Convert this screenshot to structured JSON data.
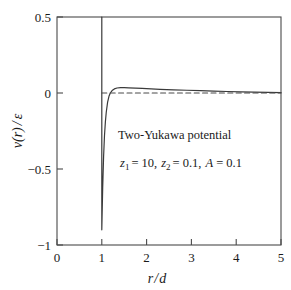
{
  "chart_data": {
    "type": "line",
    "title": "",
    "xlabel": "r/d",
    "ylabel": "v(r) / ε",
    "xlim": [
      0,
      5
    ],
    "ylim": [
      -1,
      0.5
    ],
    "xticks": [
      "0",
      "1",
      "2",
      "3",
      "4",
      "5"
    ],
    "xtick_values": [
      0,
      1,
      2,
      3,
      4,
      5
    ],
    "yticks": [
      "0.5",
      "0",
      "-0.5",
      "-1"
    ],
    "ytick_values": [
      0.5,
      0,
      -0.5,
      -1
    ],
    "grid": false,
    "legend": "none",
    "annotations": [
      {
        "text": "Two-Yukawa potential",
        "x": 1.55,
        "y": -0.33
      },
      {
        "text": "z1 = 10, z2 = 0.1, A = 0.1",
        "x": 1.55,
        "y": -0.5
      }
    ],
    "series": [
      {
        "name": "two-yukawa-potential",
        "style": "solid",
        "color": "#3a3a3a",
        "comment": "hard core vertical drop at r/d = 1, minimum -0.9, small positive maximum then decay",
        "points": [
          [
            1.0,
            -0.9
          ],
          [
            1.0,
            0.5
          ],
          [
            1.0,
            -0.9
          ],
          [
            1.02,
            -0.62
          ],
          [
            1.04,
            -0.42
          ],
          [
            1.06,
            -0.28
          ],
          [
            1.08,
            -0.19
          ],
          [
            1.1,
            -0.125
          ],
          [
            1.13,
            -0.06
          ],
          [
            1.16,
            -0.022
          ],
          [
            1.19,
            0.0
          ],
          [
            1.23,
            0.016
          ],
          [
            1.28,
            0.027
          ],
          [
            1.34,
            0.033
          ],
          [
            1.42,
            0.036
          ],
          [
            1.5,
            0.035
          ],
          [
            1.6,
            0.034
          ],
          [
            1.75,
            0.032
          ],
          [
            1.9,
            0.03
          ],
          [
            2.1,
            0.027
          ],
          [
            2.3,
            0.024
          ],
          [
            2.6,
            0.021
          ],
          [
            2.9,
            0.018
          ],
          [
            3.2,
            0.015
          ],
          [
            3.5,
            0.012
          ],
          [
            3.8,
            0.01
          ],
          [
            4.1,
            0.008
          ],
          [
            4.4,
            0.006
          ],
          [
            4.7,
            0.004
          ],
          [
            5.0,
            0.003
          ]
        ]
      },
      {
        "name": "zero-reference-line",
        "style": "dashed",
        "color": "#4a4a4a",
        "points": [
          [
            1.0,
            0.0
          ],
          [
            5.0,
            0.0
          ]
        ]
      }
    ]
  },
  "labels": {
    "annot_line1": "Two-Yukawa potential",
    "annot_z1": "z",
    "annot_z1_sub": "1",
    "annot_z1_val": "= 10,",
    "annot_z2": "z",
    "annot_z2_sub": "2",
    "annot_z2_val": "= 0.1,",
    "annot_A": "A",
    "annot_A_val": "= 0.1",
    "xaxis_r": "r",
    "xaxis_slash": "/",
    "xaxis_d": "d",
    "yaxis_v": "v",
    "yaxis_paren_open": "(",
    "yaxis_r": "r",
    "yaxis_paren_close": ")",
    "yaxis_slash": "/",
    "yaxis_eps": "ε",
    "xtick_0": "0",
    "xtick_1": "1",
    "xtick_2": "2",
    "xtick_3": "3",
    "xtick_4": "4",
    "xtick_5": "5",
    "ytick_0": "0.5",
    "ytick_1": "0",
    "ytick_2": "−0.5",
    "ytick_3": "−1"
  },
  "colors": {
    "axis": "#4a4a4a",
    "curve": "#3a3a3a",
    "dash": "#4a4a4a",
    "text": "#1a1a1a",
    "background": "#ffffff"
  }
}
